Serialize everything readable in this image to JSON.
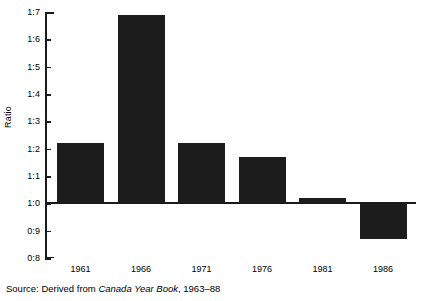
{
  "chart_data": {
    "type": "bar",
    "title": "",
    "xlabel": "",
    "ylabel": "Ratio",
    "categories": [
      "1961",
      "1966",
      "1971",
      "1976",
      "1981",
      "1986"
    ],
    "values": [
      1.22,
      1.69,
      1.22,
      1.17,
      1.02,
      0.87
    ],
    "ylim": [
      0.8,
      1.7
    ],
    "ytick_values": [
      1.7,
      1.6,
      1.5,
      1.4,
      1.3,
      1.2,
      1.1,
      1.0,
      0.9,
      0.8
    ],
    "ytick_labels": [
      "1:7",
      "1:6",
      "1:5",
      "1:4",
      "1:3",
      "1:2",
      "1:1",
      "1:0",
      "0:9",
      "0:8"
    ],
    "baseline": 1.0,
    "grid": false,
    "legend": null,
    "bar_color": "#1c1c1c"
  },
  "source": {
    "prefix": "Source: Derived from ",
    "book": "Canada Year Book",
    "suffix": ", 1963–88"
  }
}
